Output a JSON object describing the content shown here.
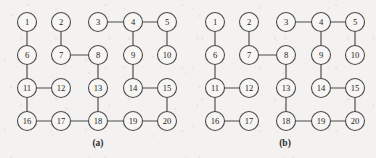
{
  "figure": {
    "background_color": "#f3f2f0",
    "ink_color": "#4a4a48",
    "node_fill_color": "#f7f6f4",
    "node_radius": 9.5,
    "panels": [
      {
        "id": "a",
        "caption": "(a)",
        "caption_x": 98,
        "caption_y": 138,
        "nodes": [
          {
            "id": 1,
            "label": "1",
            "x": 27,
            "y": 22
          },
          {
            "id": 2,
            "label": "2",
            "x": 61,
            "y": 22
          },
          {
            "id": 3,
            "label": "3",
            "x": 98,
            "y": 22
          },
          {
            "id": 4,
            "label": "4",
            "x": 133,
            "y": 22
          },
          {
            "id": 5,
            "label": "5",
            "x": 167,
            "y": 22
          },
          {
            "id": 6,
            "label": "6",
            "x": 27,
            "y": 55
          },
          {
            "id": 7,
            "label": "7",
            "x": 61,
            "y": 55
          },
          {
            "id": 8,
            "label": "8",
            "x": 98,
            "y": 55
          },
          {
            "id": 9,
            "label": "9",
            "x": 133,
            "y": 55
          },
          {
            "id": 10,
            "label": "10",
            "x": 167,
            "y": 55
          },
          {
            "id": 11,
            "label": "11",
            "x": 27,
            "y": 88
          },
          {
            "id": 12,
            "label": "12",
            "x": 61,
            "y": 88
          },
          {
            "id": 13,
            "label": "13",
            "x": 98,
            "y": 88
          },
          {
            "id": 14,
            "label": "14",
            "x": 133,
            "y": 88
          },
          {
            "id": 15,
            "label": "15",
            "x": 167,
            "y": 88
          },
          {
            "id": 16,
            "label": "16",
            "x": 27,
            "y": 121
          },
          {
            "id": 17,
            "label": "17",
            "x": 61,
            "y": 121
          },
          {
            "id": 18,
            "label": "18",
            "x": 98,
            "y": 121
          },
          {
            "id": 19,
            "label": "19",
            "x": 133,
            "y": 121
          },
          {
            "id": 20,
            "label": "20",
            "x": 167,
            "y": 121
          }
        ],
        "edges": [
          [
            1,
            6
          ],
          [
            2,
            7
          ],
          [
            7,
            8
          ],
          [
            3,
            4
          ],
          [
            4,
            5
          ],
          [
            4,
            9
          ],
          [
            5,
            10
          ],
          [
            6,
            11
          ],
          [
            11,
            12
          ],
          [
            11,
            16
          ],
          [
            8,
            13
          ],
          [
            13,
            18
          ],
          [
            9,
            14
          ],
          [
            14,
            15
          ],
          [
            15,
            20
          ],
          [
            16,
            17
          ],
          [
            17,
            18
          ],
          [
            18,
            19
          ],
          [
            19,
            20
          ]
        ]
      },
      {
        "id": "b",
        "caption": "(b)",
        "caption_x": 285,
        "caption_y": 138,
        "nodes": [
          {
            "id": 1,
            "label": "1",
            "x": 27,
            "y": 22
          },
          {
            "id": 2,
            "label": "2",
            "x": 61,
            "y": 22
          },
          {
            "id": 3,
            "label": "3",
            "x": 98,
            "y": 22
          },
          {
            "id": 4,
            "label": "4",
            "x": 133,
            "y": 22
          },
          {
            "id": 5,
            "label": "5",
            "x": 167,
            "y": 22
          },
          {
            "id": 6,
            "label": "6",
            "x": 27,
            "y": 55
          },
          {
            "id": 7,
            "label": "7",
            "x": 61,
            "y": 55
          },
          {
            "id": 8,
            "label": "8",
            "x": 98,
            "y": 55
          },
          {
            "id": 9,
            "label": "9",
            "x": 133,
            "y": 55
          },
          {
            "id": 10,
            "label": "10",
            "x": 167,
            "y": 55
          },
          {
            "id": 11,
            "label": "11",
            "x": 27,
            "y": 88
          },
          {
            "id": 12,
            "label": "12",
            "x": 61,
            "y": 88
          },
          {
            "id": 13,
            "label": "13",
            "x": 98,
            "y": 88
          },
          {
            "id": 14,
            "label": "14",
            "x": 133,
            "y": 88
          },
          {
            "id": 15,
            "label": "15",
            "x": 167,
            "y": 88
          },
          {
            "id": 16,
            "label": "16",
            "x": 27,
            "y": 121
          },
          {
            "id": 17,
            "label": "17",
            "x": 61,
            "y": 121
          },
          {
            "id": 18,
            "label": "18",
            "x": 98,
            "y": 121
          },
          {
            "id": 19,
            "label": "19",
            "x": 133,
            "y": 121
          },
          {
            "id": 20,
            "label": "20",
            "x": 167,
            "y": 121
          }
        ],
        "edges": [
          [
            1,
            6
          ],
          [
            2,
            7
          ],
          [
            7,
            8
          ],
          [
            3,
            4
          ],
          [
            4,
            5
          ],
          [
            4,
            9
          ],
          [
            5,
            10
          ],
          [
            6,
            11
          ],
          [
            11,
            12
          ],
          [
            11,
            16
          ],
          [
            8,
            13
          ],
          [
            13,
            18
          ],
          [
            9,
            14
          ],
          [
            14,
            15
          ],
          [
            15,
            20
          ],
          [
            16,
            17
          ],
          [
            18,
            19
          ],
          [
            19,
            20
          ]
        ]
      }
    ]
  }
}
